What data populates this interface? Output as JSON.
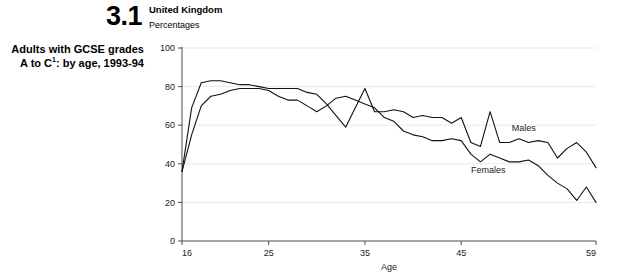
{
  "caption": {
    "figure_number": "3.1",
    "line1": "Adults with GCSE grades",
    "line2_prefix": "A to C",
    "line2_footnote": "1",
    "line2_suffix": ": by age, 1993-94"
  },
  "header": {
    "region": "United Kingdom",
    "units": "Percentages"
  },
  "chart_data": {
    "type": "line",
    "subtitle": "United Kingdom",
    "units": "Percentages",
    "xlabel": "Age",
    "ylabel": "",
    "xlim": [
      16,
      59
    ],
    "ylim": [
      0,
      100
    ],
    "grid": true,
    "grid_axis": "y",
    "legend_position": "inline-right",
    "xticks": [
      16,
      25,
      35,
      45,
      59
    ],
    "xtick_labels": [
      "16",
      "25",
      "35",
      "45",
      "59"
    ],
    "yticks": [
      0,
      20,
      40,
      60,
      80,
      100
    ],
    "ytick_labels": [
      "0",
      "20",
      "40",
      "60",
      "80",
      "100"
    ],
    "x": [
      16,
      17,
      18,
      19,
      20,
      21,
      22,
      23,
      24,
      25,
      26,
      27,
      28,
      29,
      30,
      31,
      32,
      33,
      34,
      35,
      36,
      37,
      38,
      39,
      40,
      41,
      42,
      43,
      44,
      45,
      46,
      47,
      48,
      49,
      50,
      51,
      52,
      53,
      54,
      55,
      56,
      57,
      58,
      59
    ],
    "series": [
      {
        "name": "Males",
        "label": "Males",
        "color": "#111111",
        "values": [
          36,
          69,
          82,
          83,
          83,
          82,
          81,
          81,
          80,
          79,
          79,
          79,
          79,
          77,
          76,
          71,
          65,
          59,
          69,
          79,
          67,
          67,
          68,
          67,
          64,
          65,
          64,
          64,
          61,
          64,
          51,
          49,
          67,
          51,
          51,
          53,
          51,
          52,
          51,
          43,
          48,
          51,
          46,
          38
        ]
      },
      {
        "name": "Females",
        "label": "Females",
        "color": "#111111",
        "values": [
          36,
          55,
          70,
          75,
          76,
          78,
          79,
          79,
          79,
          78,
          75,
          73,
          73,
          70,
          67,
          70,
          74,
          75,
          73,
          71,
          69,
          64,
          62,
          57,
          55,
          54,
          52,
          52,
          53,
          52,
          45,
          41,
          45,
          43,
          41,
          41,
          42,
          39,
          34,
          30,
          27,
          21,
          28,
          20
        ]
      }
    ],
    "annotations": [
      {
        "text": "Males",
        "x": 51.5,
        "y": 57
      },
      {
        "text": "Females",
        "x": 47.8,
        "y": 35
      }
    ]
  }
}
